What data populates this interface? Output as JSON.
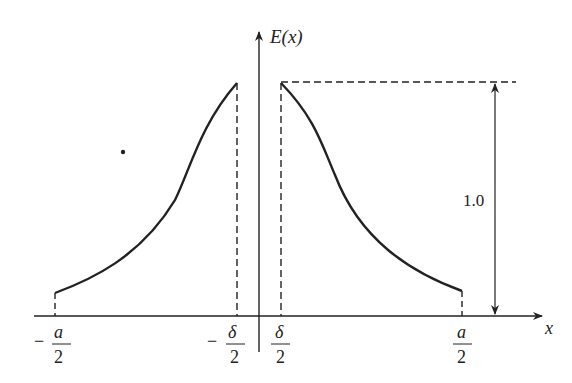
{
  "diagram": {
    "type": "field-distribution-sketch",
    "axes": {
      "y_label": "E(x)",
      "x_label": "x"
    },
    "tick_labels": [
      {
        "id": "neg-a-half",
        "sign": "−",
        "numerator": "a",
        "denominator": "2"
      },
      {
        "id": "neg-delta-half",
        "sign": "−",
        "numerator": "δ",
        "denominator": "2"
      },
      {
        "id": "pos-delta-half",
        "sign": "",
        "numerator": "δ",
        "denominator": "2"
      },
      {
        "id": "pos-a-half",
        "sign": "",
        "numerator": "a",
        "denominator": "2"
      }
    ],
    "dimension": {
      "label": "1.0"
    },
    "colors": {
      "line": "#222222",
      "background": "#ffffff"
    }
  }
}
